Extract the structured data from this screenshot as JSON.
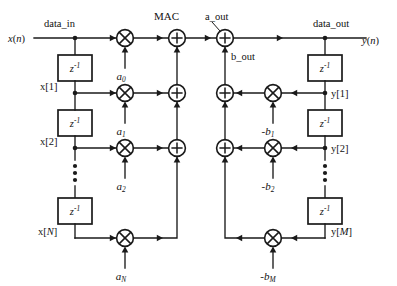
{
  "diagram": {
    "input_signal": "x(n)",
    "output_signal": "y(n)",
    "bus_labels": {
      "data_in": "data_in",
      "data_out": "data_out",
      "a_out": "a_out",
      "b_out": "b_out",
      "mac": "MAC"
    },
    "delay_label": "z",
    "delay_exponent": "-1",
    "feedforward_taps": [
      {
        "tap": "",
        "coef": "a",
        "coef_sub": "0"
      },
      {
        "tap": "x[1]",
        "coef": "a",
        "coef_sub": "1"
      },
      {
        "tap": "x[2]",
        "coef": "a",
        "coef_sub": "2"
      },
      {
        "tap": "x[N]",
        "coef": "a",
        "coef_sub": "N"
      }
    ],
    "feedback_taps": [
      {
        "tap": "y[1]",
        "coef": "-b",
        "coef_sub": "1"
      },
      {
        "tap": "y[2]",
        "coef": "-b",
        "coef_sub": "2"
      },
      {
        "tap": "y[M]",
        "coef": "-b",
        "coef_sub": "M"
      }
    ],
    "operators": {
      "multiply": "multiply-operator",
      "add": "add-operator"
    },
    "colors": {
      "stroke": "#1a1a1a",
      "background": "#ffffff"
    }
  }
}
